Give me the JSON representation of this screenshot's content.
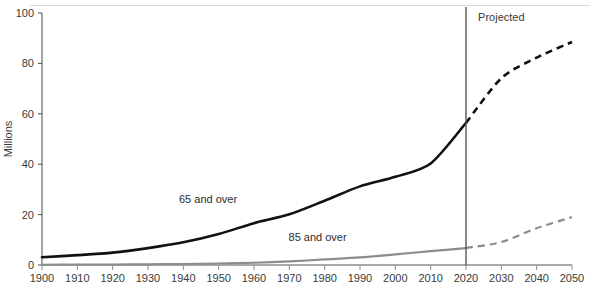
{
  "chart_data": {
    "type": "line",
    "title": "",
    "subtitle": "",
    "xlabel": "",
    "ylabel": "Millions",
    "xlim": [
      1900,
      2050
    ],
    "ylim": [
      0,
      100
    ],
    "grid": false,
    "legend_position": "inline-labels",
    "x_ticks": [
      1900,
      1910,
      1920,
      1930,
      1940,
      1950,
      1960,
      1970,
      1980,
      1990,
      2000,
      2010,
      2020,
      2030,
      2040,
      2050
    ],
    "y_ticks": [
      0,
      20,
      40,
      60,
      80,
      100
    ],
    "x": [
      1900,
      1910,
      1920,
      1930,
      1940,
      1950,
      1960,
      1970,
      1980,
      1990,
      2000,
      2010,
      2020,
      2030,
      2040,
      2050
    ],
    "series": [
      {
        "name": "65 and over",
        "label": "65 and over",
        "color": "#111111",
        "style": "solid-then-dashed",
        "dash_from": 2020,
        "values": [
          3.1,
          3.9,
          4.9,
          6.7,
          9.0,
          12.3,
          16.6,
          20.1,
          25.5,
          31.2,
          35.0,
          40.3,
          56.4,
          74.1,
          82.3,
          88.5
        ]
      },
      {
        "name": "85 and over",
        "label": "85 and over",
        "color": "#8c8c8c",
        "style": "solid-then-dashed",
        "dash_from": 2020,
        "values": [
          0.1,
          0.2,
          0.2,
          0.3,
          0.4,
          0.6,
          0.9,
          1.4,
          2.2,
          3.0,
          4.2,
          5.5,
          6.7,
          9.1,
          14.6,
          19.0
        ]
      }
    ],
    "annotations": [
      {
        "name": "projected-divider",
        "type": "vline",
        "x": 2020,
        "color": "#555555"
      },
      {
        "name": "projected-label",
        "type": "text",
        "text": "Projected",
        "x": 2030,
        "y": 97
      }
    ],
    "series_label_positions": [
      {
        "label": "65 and over",
        "x": 1947,
        "y": 24.5
      },
      {
        "label": "85 and over",
        "x": 1978,
        "y": 9.5
      }
    ]
  }
}
